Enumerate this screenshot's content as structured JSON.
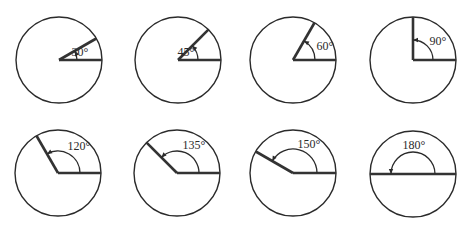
{
  "diagram": {
    "stroke_color": "#2b2b2b",
    "ray_color": "#333333",
    "background": "#ffffff",
    "circles": [
      {
        "id": "angle-30",
        "angle": 30,
        "label": "30°",
        "cx": 59,
        "cy": 60,
        "r": 43,
        "arc_r": 18,
        "label_x": 80,
        "label_y": 56
      },
      {
        "id": "angle-45",
        "angle": 45,
        "label": "45°",
        "cx": 178,
        "cy": 60,
        "r": 43,
        "arc_r": 20,
        "label_x": 186,
        "label_y": 56
      },
      {
        "id": "angle-60",
        "angle": 60,
        "label": "60°",
        "cx": 293,
        "cy": 60,
        "r": 43,
        "arc_r": 22,
        "label_x": 325,
        "label_y": 50
      },
      {
        "id": "angle-90",
        "angle": 90,
        "label": "90°",
        "cx": 413,
        "cy": 60,
        "r": 43,
        "arc_r": 20,
        "label_x": 438,
        "label_y": 45
      },
      {
        "id": "angle-120",
        "angle": 120,
        "label": "120°",
        "cx": 58,
        "cy": 173,
        "r": 43,
        "arc_r": 22,
        "label_x": 79,
        "label_y": 150
      },
      {
        "id": "angle-135",
        "angle": 135,
        "label": "135°",
        "cx": 177,
        "cy": 173,
        "r": 43,
        "arc_r": 22,
        "label_x": 194,
        "label_y": 149
      },
      {
        "id": "angle-150",
        "angle": 150,
        "label": "150°",
        "cx": 293,
        "cy": 173,
        "r": 43,
        "arc_r": 24,
        "label_x": 309,
        "label_y": 148
      },
      {
        "id": "angle-180",
        "angle": 180,
        "label": "180°",
        "cx": 413,
        "cy": 174,
        "r": 43,
        "arc_r": 22,
        "label_x": 414,
        "label_y": 149
      }
    ]
  }
}
